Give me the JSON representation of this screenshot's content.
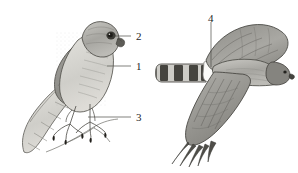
{
  "figure": {
    "type": "scientific-illustration",
    "medium": "graphite-pencil-grayscale",
    "background_color": "#ffffff",
    "ink_color": "#2b2b2b",
    "label_color": "#1e1e1e",
    "plumage_gray": "#9a9a96",
    "plumage_light": "#d8d7d2",
    "plumage_dark": "#6d6d68",
    "band_dark": "#4a4a46"
  },
  "panels": [
    {
      "name": "perched-bird",
      "position": "left",
      "pose": "perched on branch, facing right"
    },
    {
      "name": "flying-bird",
      "position": "right",
      "pose": "in flight, wings spread, tail extended left"
    }
  ],
  "labels": [
    {
      "id": "label-1",
      "text": "1",
      "x": 136,
      "y": 62,
      "target": "breast-flank",
      "leader": "horizontal"
    },
    {
      "id": "label-2",
      "text": "2",
      "x": 136,
      "y": 31,
      "target": "eye",
      "leader": "horizontal"
    },
    {
      "id": "label-3",
      "text": "3",
      "x": 136,
      "y": 111,
      "target": "foot-talons",
      "leader": "horizontal"
    },
    {
      "id": "label-4",
      "text": "4",
      "x": 208,
      "y": 14,
      "target": "rump-tail-base",
      "leader": "vertical"
    }
  ],
  "leader_lines": [
    {
      "id": "leader-1",
      "x1": 107,
      "y1": 66,
      "x2": 131,
      "y2": 66
    },
    {
      "id": "leader-2",
      "x1": 113,
      "y1": 36,
      "x2": 131,
      "y2": 36
    },
    {
      "id": "leader-3",
      "x1": 88,
      "y1": 117,
      "x2": 131,
      "y2": 117
    },
    {
      "id": "leader-4",
      "x1": 211,
      "y1": 22,
      "x2": 211,
      "y2": 67
    }
  ],
  "features": {
    "tail_bands_flying": 4,
    "tail_bands_perched": 4,
    "wings_shown": 2
  }
}
